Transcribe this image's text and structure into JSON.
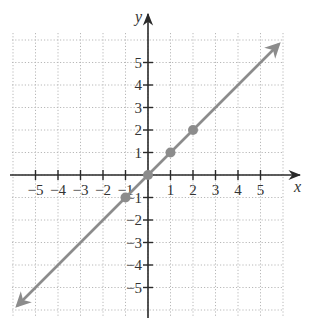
{
  "chart_data": {
    "type": "line",
    "title": "",
    "xlabel": "x",
    "ylabel": "y",
    "xlim": [
      -6,
      6
    ],
    "ylim": [
      -6,
      6
    ],
    "grid": true,
    "x_ticks": [
      -5,
      -4,
      -3,
      -2,
      -1,
      1,
      2,
      3,
      4,
      5
    ],
    "y_ticks": [
      -5,
      -4,
      -3,
      -2,
      -1,
      1,
      2,
      3,
      4,
      5
    ],
    "x_tick_labels": [
      "−5",
      "−4",
      "−3",
      "−2",
      "−1",
      "1",
      "2",
      "3",
      "4",
      "5"
    ],
    "y_tick_labels": [
      "−5",
      "−4",
      "−3",
      "−2",
      "−1",
      "1",
      "2",
      "3",
      "4",
      "5"
    ],
    "series": [
      {
        "name": "y = x",
        "kind": "line-with-arrows",
        "x": [
          -5.8,
          5.8
        ],
        "y": [
          -5.8,
          5.8
        ],
        "color": "#8c8c8c"
      },
      {
        "name": "plotted points",
        "kind": "scatter",
        "points": [
          [
            -1,
            -1
          ],
          [
            0,
            0
          ],
          [
            1,
            1
          ],
          [
            2,
            2
          ]
        ],
        "color": "#8c8c8c"
      }
    ],
    "legend": null
  },
  "labels": {
    "x_axis": "x",
    "y_axis": "y"
  }
}
